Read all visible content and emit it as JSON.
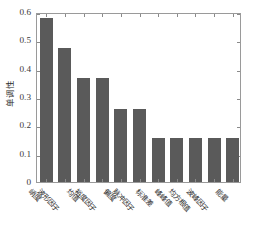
{
  "chart_data": {
    "type": "bar",
    "title": "",
    "subtitle": "",
    "xlabel": "",
    "ylabel": "单调性",
    "categories": [
      "峭度",
      "波形因子",
      "均值",
      "裕度因子",
      "偏度",
      "脉冲因子",
      "标准差",
      "峰峰值",
      "均方根值",
      "波峰因子",
      "能量"
    ],
    "values": [
      0.578,
      0.473,
      0.366,
      0.366,
      0.259,
      0.259,
      0.155,
      0.155,
      0.155,
      0.155,
      0.155
    ],
    "ylim": [
      0,
      0.6
    ],
    "xlim_count": 11,
    "yticks": [
      0,
      0.1,
      0.2,
      0.3,
      0.4,
      0.5,
      0.6
    ],
    "ytick_labels": [
      "0",
      "0.1",
      "0.2",
      "0.3",
      "0.4",
      "0.5",
      "0.6"
    ],
    "grid": false,
    "legend": null,
    "bar_color": "#5a5a5a",
    "axis_color": "#9a9a9a",
    "background": "#ffffff"
  }
}
